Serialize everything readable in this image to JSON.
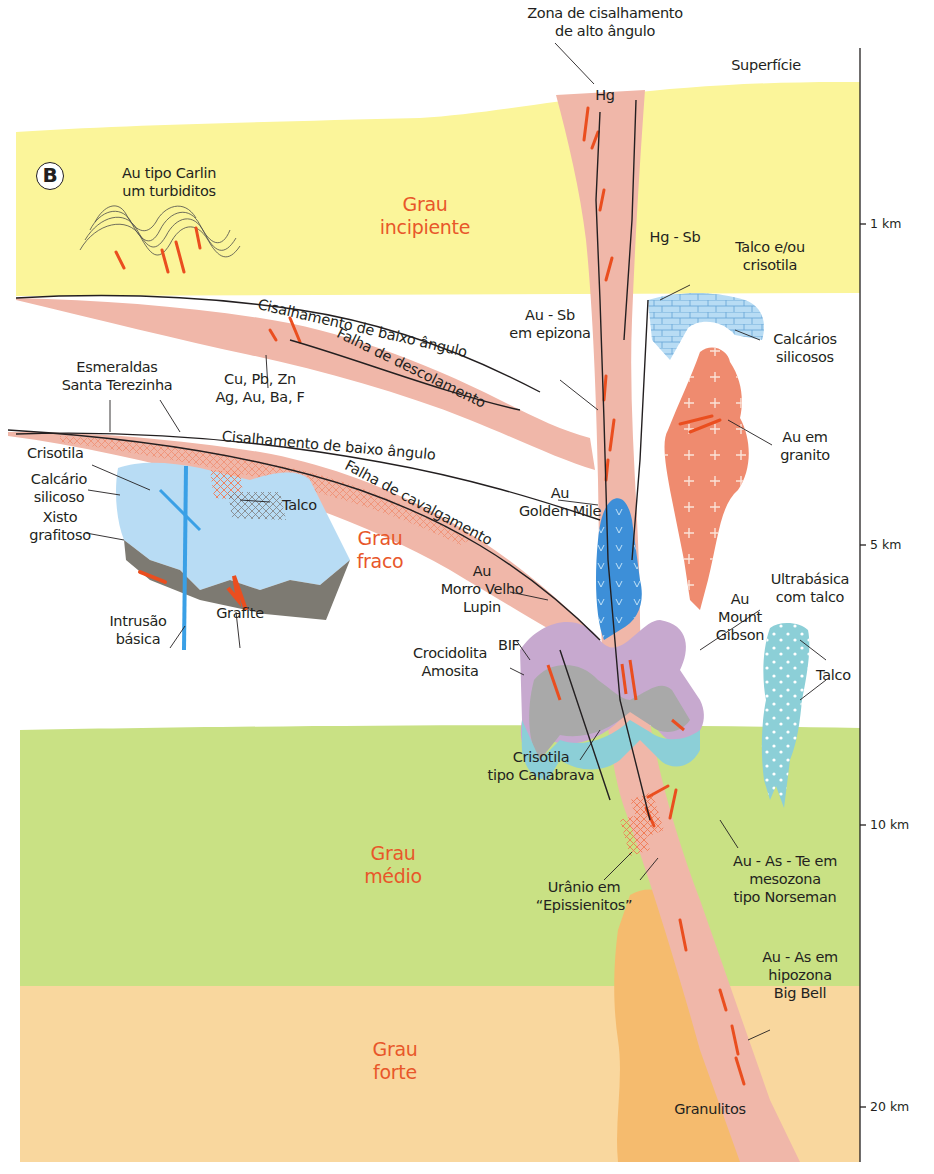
{
  "diagram": {
    "panel_letter": "B",
    "surface_label": "Superfície",
    "colors": {
      "incipient_zone": "#fbf59a",
      "medium_zone": "#c9e184",
      "strong_zone": "#f9d79e",
      "shear_zone": "#f0b7a9",
      "granite": "#ef8b6f",
      "granulite": "#f5bb6e",
      "ore": "#ea4e1f",
      "limestone": "#b8dcf4",
      "ultrabasic": "#8ccfd7",
      "grade_text": "#e8572a"
    },
    "grades": [
      {
        "id": "incipiente",
        "label": "Grau\nincipiente"
      },
      {
        "id": "fraco",
        "label": "Grau\nfraco"
      },
      {
        "id": "medio",
        "label": "Grau\nmédio"
      },
      {
        "id": "forte",
        "label": "Grau\nforte"
      }
    ],
    "depth_scale": {
      "ticks": [
        {
          "label": "1 km"
        },
        {
          "label": "5 km"
        },
        {
          "label": "10 km"
        },
        {
          "label": "20 km"
        }
      ]
    },
    "structures": {
      "high_angle_shear": "Zona de cisalhamento\nde alto ângulo",
      "low_angle_shear_upper": "Cisalhamento de baixo ângulo",
      "detachment_fault": "Falha de descolamento",
      "low_angle_shear_lower": "Cisalhamento de baixo ângulo",
      "thrust_fault": "Falha de cavalgamento"
    },
    "labels": {
      "carlin": "Au tipo Carlin\num turbiditos",
      "hg": "Hg",
      "hg_sb": "Hg - Sb",
      "talco_crisotila": "Talco e/ou\ncrisotila",
      "calcarios_silicosos": "Calcários\nsilicosos",
      "au_sb": "Au - Sb\nem epizona",
      "cu_pb_zn": "Cu, Pb, Zn\nAg, Au, Ba, F",
      "esmeraldas": "Esmeraldas\nSanta Terezinha",
      "au_granito": "Au em\ngranito",
      "crisotila": "Crisotila",
      "calcario_silicoso": "Calcário\nsilicoso",
      "xisto": "Xisto\ngrafitoso",
      "talco_left": "Talco",
      "au_golden_mile": "Au\nGolden Mile",
      "intrusao": "Intrusão\nbásica",
      "grafite": "Grafite",
      "au_morro_velho": "Au\nMorro Velho\nLupin",
      "ultrabasica": "Ultrabásica\ncom talco",
      "au_mount_gibson": "Au\nMount\nGibson",
      "bif": "BIF",
      "crocidolita": "Crocidolita\nAmosita",
      "talco_right": "Talco",
      "crisotila_canabrava": "Crisotila\ntipo Canabrava",
      "au_as_te": "Au - As - Te em\nmesozona\ntipo Norseman",
      "uranio": "Urânio em\n“Epissienitos”",
      "au_as": "Au - As em\nhipozona\nBig Bell",
      "granulitos": "Granulitos"
    }
  }
}
